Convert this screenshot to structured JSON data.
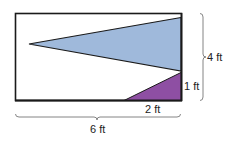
{
  "diagram": {
    "rectangle": {
      "width_label": "6 ft",
      "height_label": "4 ft"
    },
    "blue_triangle": {
      "color": "#9fb9db"
    },
    "purple_triangle": {
      "color": "#8e4fa3",
      "base_label": "2 ft",
      "height_label": "1 ft"
    },
    "colors": {
      "outline": "#1a1a1a",
      "brace": "#777777",
      "background": "#ffffff"
    }
  }
}
